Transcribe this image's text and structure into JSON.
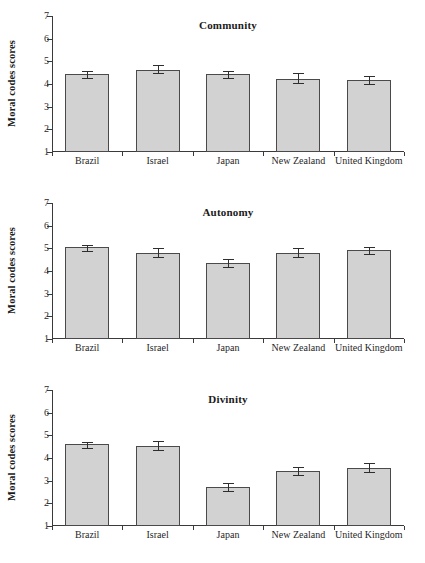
{
  "figure": {
    "ylabel": "Moral codes scores",
    "categories": [
      "Brazil",
      "Israel",
      "Japan",
      "New Zealand",
      "United Kingdom"
    ],
    "yticks": [
      "1",
      "2",
      "3",
      "4",
      "5",
      "6",
      "7"
    ],
    "ylim": [
      1,
      7
    ]
  },
  "chart_data": [
    {
      "type": "bar",
      "title": "Community",
      "xlabel": "",
      "ylabel": "Moral codes scores",
      "categories": [
        "Brazil",
        "Israel",
        "Japan",
        "New Zealand",
        "United Kingdom"
      ],
      "values": [
        4.46,
        4.64,
        4.43,
        4.22,
        4.17
      ],
      "errors": [
        0.11,
        0.21,
        0.15,
        0.25,
        0.18
      ],
      "ylim": [
        1,
        7
      ],
      "yticks": [
        1,
        2,
        3,
        4,
        5,
        6,
        7
      ],
      "grid": false,
      "legend": "none"
    },
    {
      "type": "bar",
      "title": "Autonomy",
      "xlabel": "",
      "ylabel": "Moral codes scores",
      "categories": [
        "Brazil",
        "Israel",
        "Japan",
        "New Zealand",
        "United Kingdom"
      ],
      "values": [
        5.07,
        4.81,
        4.36,
        4.81,
        4.91
      ],
      "errors": [
        0.09,
        0.22,
        0.16,
        0.22,
        0.17
      ],
      "ylim": [
        1,
        7
      ],
      "yticks": [
        1,
        2,
        3,
        4,
        5,
        6,
        7
      ],
      "grid": false,
      "legend": "none"
    },
    {
      "type": "bar",
      "title": "Divinity",
      "xlabel": "",
      "ylabel": "Moral codes scores",
      "categories": [
        "Brazil",
        "Israel",
        "Japan",
        "New Zealand",
        "United Kingdom"
      ],
      "values": [
        4.62,
        4.51,
        2.71,
        3.41,
        3.58
      ],
      "errors": [
        0.09,
        0.22,
        0.17,
        0.21,
        0.2
      ],
      "ylim": [
        1,
        7
      ],
      "yticks": [
        1,
        2,
        3,
        4,
        5,
        6,
        7
      ],
      "grid": false,
      "legend": "none"
    }
  ]
}
